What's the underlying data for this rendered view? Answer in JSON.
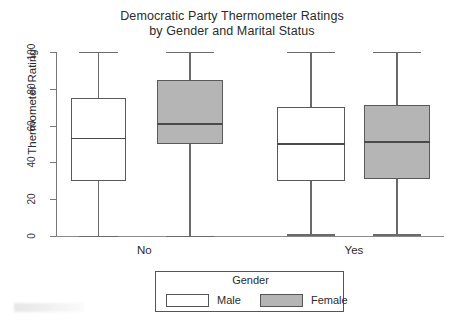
{
  "chart_data": {
    "type": "box",
    "title": "Democratic Party Thermometer Ratings",
    "subtitle": "by Gender and Marital Status",
    "xlabel": "",
    "ylabel": "Thermometer Rating",
    "ylim": [
      0,
      100
    ],
    "yticks": [
      0,
      20,
      40,
      60,
      80,
      100
    ],
    "ytick_labels": [
      "0",
      "20",
      "40",
      "60",
      "80",
      "100"
    ],
    "grid": false,
    "categories": [
      "No",
      "Yes"
    ],
    "group_label": "Gender",
    "legend": {
      "title": "Gender",
      "position": "bottom",
      "entries": [
        {
          "name": "Male",
          "fill": "#ffffff"
        },
        {
          "name": "Female",
          "fill": "#b5b5b5"
        }
      ]
    },
    "series": [
      {
        "name": "Male",
        "fill": "#ffffff",
        "boxes": [
          {
            "category": "No",
            "whisker_low": 0,
            "q1": 30,
            "median": 53,
            "q3": 75,
            "whisker_high": 100
          },
          {
            "category": "Yes",
            "whisker_low": 1,
            "q1": 30,
            "median": 50,
            "q3": 70,
            "whisker_high": 100
          }
        ]
      },
      {
        "name": "Female",
        "fill": "#b5b5b5",
        "boxes": [
          {
            "category": "No",
            "whisker_low": 0,
            "q1": 50,
            "median": 61,
            "q3": 85,
            "whisker_high": 100
          },
          {
            "category": "Yes",
            "whisker_low": 1,
            "q1": 31,
            "median": 51,
            "q3": 71,
            "whisker_high": 100
          }
        ]
      }
    ]
  },
  "colors": {
    "axis": "#777777",
    "box_stroke": "#5a5a5a",
    "female_fill": "#b5b5b5",
    "male_fill": "#ffffff",
    "text": "#2b2b2b"
  }
}
